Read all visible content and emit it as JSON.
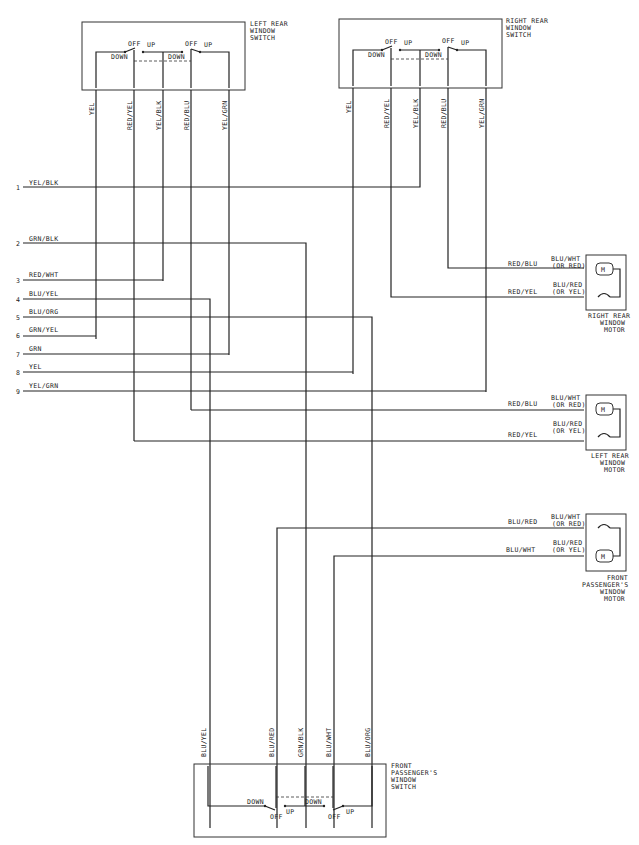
{
  "components": {
    "left_rear_switch": {
      "label_lines": [
        "LEFT REAR",
        "WINDOW",
        "SWITCH"
      ],
      "wires": [
        "YEL",
        "RED/YEL",
        "YEL/BLK",
        "RED/BLU",
        "YEL/GRN"
      ],
      "contacts": {
        "off1": "OFF",
        "up1": "UP",
        "down1": "DOWN",
        "off2": "OFF",
        "up2": "UP",
        "down2": "DOWN"
      }
    },
    "right_rear_switch": {
      "label_lines": [
        "RIGHT REAR",
        "WINDOW",
        "SWITCH"
      ],
      "wires": [
        "YEL",
        "RED/YEL",
        "YEL/BLK",
        "RED/BLU",
        "YEL/GRN"
      ],
      "contacts": {
        "off1": "OFF",
        "up1": "UP",
        "down1": "DOWN",
        "off2": "OFF",
        "up2": "UP",
        "down2": "DOWN"
      }
    },
    "right_rear_motor": {
      "label_lines": [
        "RIGHT REAR",
        "WINDOW",
        "MOTOR"
      ],
      "in_wires": [
        "RED/BLU",
        "RED/YEL"
      ],
      "motor_wires": [
        [
          "BLU/WHT",
          "(OR RED)"
        ],
        [
          "BLU/RED",
          "(OR YEL)"
        ]
      ],
      "motor_symbol": "M"
    },
    "left_rear_motor": {
      "label_lines": [
        "LEFT REAR",
        "WINDOW",
        "MOTOR"
      ],
      "in_wires": [
        "RED/BLU",
        "RED/YEL"
      ],
      "motor_wires": [
        [
          "BLU/WHT",
          "(OR RED)"
        ],
        [
          "BLU/RED",
          "(OR YEL)"
        ]
      ],
      "motor_symbol": "M"
    },
    "front_passenger_motor": {
      "label_lines": [
        "FRONT",
        "PASSENGER'S",
        "WINDOW",
        "MOTOR"
      ],
      "in_wires": [
        "BLU/RED",
        "BLU/WHT"
      ],
      "motor_wires": [
        [
          "BLU/WHT",
          "(OR RED)"
        ],
        [
          "BLU/RED",
          "(OR YEL)"
        ]
      ],
      "motor_symbol": "M"
    },
    "front_passenger_switch": {
      "label_lines": [
        "FRONT",
        "PASSENGER'S",
        "WINDOW",
        "SWITCH"
      ],
      "wires": [
        "BLU/YEL",
        "BLU/RED",
        "GRN/BLK",
        "BLU/WHT",
        "BLU/ORG"
      ],
      "contacts": {
        "down1": "DOWN",
        "off1": "OFF",
        "up1": "UP",
        "down2": "DOWN",
        "off2": "OFF",
        "up2": "UP"
      }
    }
  },
  "connector_pins": [
    {
      "num": "1",
      "color": "YEL/BLK"
    },
    {
      "num": "2",
      "color": "GRN/BLK"
    },
    {
      "num": "3",
      "color": "RED/WHT"
    },
    {
      "num": "4",
      "color": "BLU/YEL"
    },
    {
      "num": "5",
      "color": "BLU/ORG"
    },
    {
      "num": "6",
      "color": "GRN/YEL"
    },
    {
      "num": "7",
      "color": "GRN"
    },
    {
      "num": "8",
      "color": "YEL"
    },
    {
      "num": "9",
      "color": "YEL/GRN"
    }
  ]
}
